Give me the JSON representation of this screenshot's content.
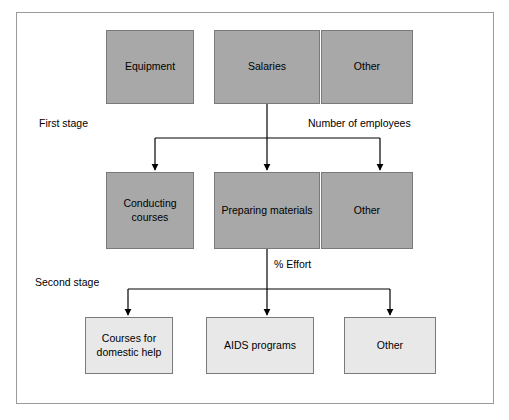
{
  "diagram": {
    "stage_labels": {
      "first": "First stage",
      "second": "Second stage"
    },
    "driver_labels": {
      "employees": "Number of employees",
      "effort": "% Effort"
    },
    "row1": [
      {
        "label": "Equipment",
        "shade": "gray"
      },
      {
        "label": "Salaries",
        "shade": "gray"
      },
      {
        "label": "Other",
        "shade": "gray"
      }
    ],
    "row2": [
      {
        "label": "Conducting courses",
        "shade": "gray"
      },
      {
        "label": "Preparing materials",
        "shade": "gray"
      },
      {
        "label": "Other",
        "shade": "gray"
      }
    ],
    "row3": [
      {
        "label": "Courses for domestic help",
        "shade": "light"
      },
      {
        "label": "AIDS programs",
        "shade": "light"
      },
      {
        "label": "Other",
        "shade": "light"
      }
    ],
    "colors": {
      "gray_fill": "#a8a8a8",
      "light_fill": "#e8e8e8",
      "border": "#7a7a7a",
      "frame": "#9a9a9a",
      "arrow": "#000000"
    }
  }
}
